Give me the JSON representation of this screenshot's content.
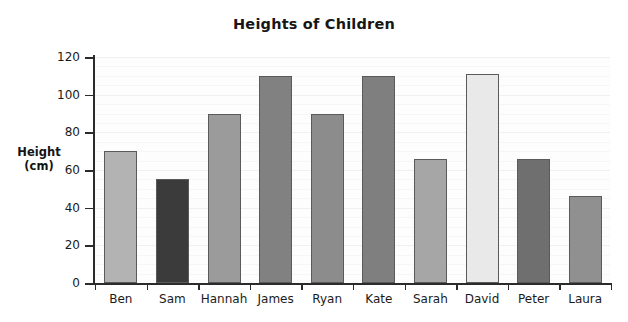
{
  "chart_data": {
    "type": "bar",
    "title": "Heights of Children",
    "xlabel": "",
    "ylabel": "Height (cm)",
    "ylabel_lines": [
      "Height",
      "(cm)"
    ],
    "categories": [
      "Ben",
      "Sam",
      "Hannah",
      "James",
      "Ryan",
      "Kate",
      "Sarah",
      "David",
      "Peter",
      "Laura"
    ],
    "values": [
      70,
      55,
      90,
      110,
      90,
      110,
      66,
      111,
      66,
      46
    ],
    "ylim": [
      0,
      125
    ],
    "ytick_labels": [
      "0",
      "20",
      "40",
      "60",
      "80",
      "100",
      "120"
    ],
    "ytick_values": [
      0,
      20,
      40,
      60,
      80,
      100,
      120
    ],
    "grid": true,
    "grid_orientation": "horizontal",
    "legend": false,
    "bar_colors": [
      "#b3b3b3",
      "#3b3b3b",
      "#9b9b9b",
      "#818181",
      "#8c8c8c",
      "#7f7f7f",
      "#a6a6a6",
      "#e9e9e9",
      "#6f6f6f",
      "#909090"
    ],
    "bar_border_color": "#5a5a5a",
    "axis_color": "#2b2b2b",
    "background_color": "#ffffff",
    "plot_background_color": "#fdfdfd",
    "gridline_color": "#f0f0f2"
  }
}
